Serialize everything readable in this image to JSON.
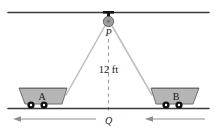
{
  "figure": {
    "labels": {
      "pulley_point": "P",
      "ground_point": "Q",
      "height": "12 ft",
      "cart_left": "A",
      "cart_right": "B"
    },
    "colors": {
      "line": "#3a3a3a",
      "cable": "#b9b9b9",
      "cart_fill": "#b5b5b5",
      "cart_stroke": "#6b6b6b",
      "pulley_fill": "#9a9a9a",
      "wheel": "#111111",
      "arrow": "#8e8e8e",
      "background": "#ffffff"
    },
    "geometry": {
      "beam_y": 12,
      "ground_y": 108,
      "pulley_x": 108,
      "pulley_y": 20,
      "height_ft": 12
    },
    "arrows": {
      "left_direction": "left",
      "right_direction": "left"
    }
  }
}
